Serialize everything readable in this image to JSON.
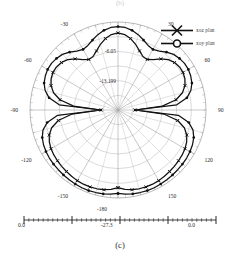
{
  "figure": {
    "caption": "(c)",
    "top_fragment": "(b)"
  },
  "legend": {
    "items": [
      {
        "label": "xoz plan",
        "marker": "x-marker",
        "name": "legend-item-xoz"
      },
      {
        "label": "xoy plan",
        "marker": "o-marker",
        "name": "legend-item-xoy"
      }
    ]
  },
  "scalebar": {
    "left_label": "0.0",
    "mid_label": "-27.3",
    "right_label": "0.0",
    "top_label": "-180"
  },
  "chart_data": {
    "type": "line",
    "subtype": "polar-radiation-pattern",
    "title": "",
    "subtitle": "",
    "xlabel": "Theta (deg)",
    "ylabel": "Gain (dB)",
    "grid": true,
    "legend_position": "top-right",
    "angle_unit": "degrees",
    "angle_ticks": [
      {
        "value": 0,
        "label": "0.0"
      },
      {
        "value": 30,
        "label": "30"
      },
      {
        "value": 60,
        "label": "60"
      },
      {
        "value": 90,
        "label": "90"
      },
      {
        "value": 120,
        "label": "120"
      },
      {
        "value": 150,
        "label": "150"
      },
      {
        "value": 180,
        "label": "-180"
      },
      {
        "value": -150,
        "label": "-150"
      },
      {
        "value": -120,
        "label": "-120"
      },
      {
        "value": -90,
        "label": "-90"
      },
      {
        "value": -60,
        "label": "-60"
      },
      {
        "value": -30,
        "label": "-30"
      }
    ],
    "radial_ticks": [
      {
        "value": 0.0,
        "label": "0.0",
        "r_frac": 1.0
      },
      {
        "value": -6.05,
        "label": "-6.05",
        "r_frac": 0.666
      },
      {
        "value": -13.199,
        "label": "-13.199",
        "r_frac": 0.333
      }
    ],
    "rlim": [
      -27.3,
      0.0
    ],
    "series": [
      {
        "name": "xoz plan",
        "marker": "x",
        "angles": [
          -180,
          -175,
          -170,
          -165,
          -160,
          -155,
          -150,
          -145,
          -140,
          -135,
          -130,
          -125,
          -120,
          -115,
          -110,
          -105,
          -100,
          -95,
          -90,
          -85,
          -80,
          -75,
          -70,
          -65,
          -60,
          -55,
          -50,
          -45,
          -40,
          -35,
          -30,
          -25,
          -20,
          -15,
          -10,
          -5,
          0,
          5,
          10,
          15,
          20,
          25,
          30,
          35,
          40,
          45,
          50,
          55,
          60,
          65,
          70,
          75,
          80,
          85,
          90,
          95,
          100,
          105,
          110,
          115,
          120,
          125,
          130,
          135,
          140,
          145,
          150,
          155,
          160,
          165,
          170,
          175,
          180
        ],
        "values": [
          -3.2,
          -2.6,
          -2.2,
          -2.0,
          -1.9,
          -1.9,
          -2.0,
          -2.2,
          -2.4,
          -2.6,
          -2.8,
          -3.0,
          -3.3,
          -3.8,
          -4.6,
          -6.0,
          -8.5,
          -13.0,
          -22.0,
          -13.5,
          -9.0,
          -6.6,
          -5.2,
          -4.4,
          -4.0,
          -4.0,
          -4.4,
          -5.2,
          -6.6,
          -8.2,
          -9.2,
          -9.0,
          -7.8,
          -6.2,
          -4.8,
          -3.8,
          -3.4,
          -3.8,
          -4.8,
          -6.2,
          -7.8,
          -9.0,
          -9.2,
          -8.2,
          -6.6,
          -5.2,
          -4.4,
          -4.0,
          -4.0,
          -4.4,
          -5.2,
          -6.6,
          -9.0,
          -13.5,
          -22.0,
          -13.0,
          -8.5,
          -6.0,
          -4.6,
          -3.8,
          -3.3,
          -3.0,
          -2.8,
          -2.6,
          -2.4,
          -2.2,
          -2.0,
          -1.9,
          -1.9,
          -2.0,
          -2.2,
          -2.6,
          -3.2
        ]
      },
      {
        "name": "xoy plan",
        "marker": "o",
        "angles": [
          -180,
          -175,
          -170,
          -165,
          -160,
          -155,
          -150,
          -145,
          -140,
          -135,
          -130,
          -125,
          -120,
          -115,
          -110,
          -105,
          -100,
          -95,
          -90,
          -85,
          -80,
          -75,
          -70,
          -65,
          -60,
          -55,
          -50,
          -45,
          -40,
          -35,
          -30,
          -25,
          -20,
          -15,
          -10,
          -5,
          0,
          5,
          10,
          15,
          20,
          25,
          30,
          35,
          40,
          45,
          50,
          55,
          60,
          65,
          70,
          75,
          80,
          85,
          90,
          95,
          100,
          105,
          110,
          115,
          120,
          125,
          130,
          135,
          140,
          145,
          150,
          155,
          160,
          165,
          170,
          175,
          180
        ],
        "values": [
          -1.4,
          -1.1,
          -0.9,
          -0.8,
          -0.7,
          -0.7,
          -0.8,
          -0.9,
          -1.0,
          -1.1,
          -1.2,
          -1.3,
          -1.5,
          -1.8,
          -2.3,
          -3.2,
          -5.0,
          -8.5,
          -22.0,
          -9.0,
          -5.6,
          -3.9,
          -2.9,
          -2.4,
          -2.1,
          -2.1,
          -2.4,
          -2.9,
          -3.9,
          -5.0,
          -5.6,
          -5.2,
          -4.2,
          -3.1,
          -2.2,
          -1.6,
          -1.4,
          -1.6,
          -2.2,
          -3.1,
          -4.2,
          -5.2,
          -5.6,
          -5.0,
          -3.9,
          -2.9,
          -2.4,
          -2.1,
          -2.1,
          -2.4,
          -2.9,
          -3.9,
          -5.6,
          -9.0,
          -22.0,
          -8.5,
          -5.0,
          -3.2,
          -2.3,
          -1.8,
          -1.5,
          -1.3,
          -1.2,
          -1.1,
          -1.0,
          -0.9,
          -0.8,
          -0.7,
          -0.7,
          -0.8,
          -0.9,
          -1.1,
          -1.4
        ]
      }
    ]
  }
}
